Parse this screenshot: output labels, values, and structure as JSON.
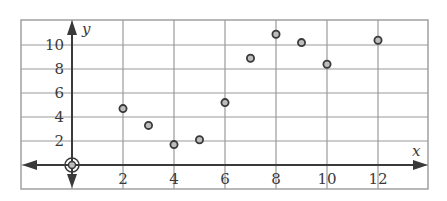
{
  "chart_data": {
    "type": "scatter",
    "title": "",
    "xlabel": "x",
    "ylabel": "y",
    "xlim": [
      -2,
      14
    ],
    "ylim": [
      -2,
      12
    ],
    "grid": true,
    "legend": null,
    "x_ticks": [
      2,
      4,
      6,
      8,
      10,
      12
    ],
    "y_ticks": [
      2,
      4,
      6,
      8,
      10
    ],
    "x_tick_labels": [
      "2",
      "4",
      "6",
      "8",
      "10",
      "12"
    ],
    "y_tick_labels": [
      "2",
      "4",
      "6",
      "8",
      "10"
    ],
    "series": [
      {
        "name": "points",
        "x": [
          2,
          3,
          4,
          5,
          6,
          7,
          8,
          9,
          10,
          12
        ],
        "y": [
          4.7,
          3.3,
          1.7,
          2.1,
          5.2,
          8.9,
          10.9,
          10.2,
          8.4,
          10.4
        ]
      }
    ],
    "annotations": [
      "origin marked with concentric circle"
    ]
  },
  "labels": {
    "x_axis": "x",
    "y_axis": "y"
  },
  "colors": {
    "grid": "#9a9a9a",
    "axis": "#3a3a3a",
    "point_fill": "#bdbdbd",
    "point_stroke": "#3a3a3a"
  }
}
